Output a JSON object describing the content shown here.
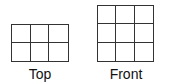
{
  "views": [
    {
      "label": "Top",
      "rows": 2,
      "cols": 3
    },
    {
      "label": "Front",
      "rows": 3,
      "cols": 3
    }
  ]
}
